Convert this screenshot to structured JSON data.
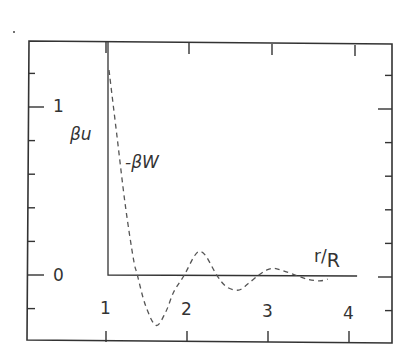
{
  "chart_data": {
    "type": "line",
    "title": "",
    "xlabel": "r/R",
    "ylabel": "βu",
    "curve_label": "-βW",
    "xlim": [
      0.0,
      4.5
    ],
    "ylim": [
      -0.4,
      1.4
    ],
    "x_ticks": [
      1,
      2,
      3,
      4
    ],
    "x_tick_labels": [
      "1",
      "2",
      "3",
      "4"
    ],
    "y_ticks": [
      -0.2,
      0,
      0.2,
      0.4,
      0.6,
      0.8,
      1.0,
      1.2
    ],
    "y_tick_labels": [
      "0",
      "1"
    ],
    "y_labeled_ticks": [
      0,
      1
    ],
    "grid": false,
    "legend": null,
    "series": [
      {
        "name": "βu (hard-core potential)",
        "style": "solid",
        "x": [
          1.0,
          1.0,
          4.1
        ],
        "y": [
          1.4,
          0.0,
          0.0
        ]
      },
      {
        "name": "-βW",
        "style": "dashed",
        "x": [
          1.0,
          1.1,
          1.2,
          1.3,
          1.35,
          1.45,
          1.58,
          1.7,
          1.8,
          1.93,
          2.05,
          2.12,
          2.2,
          2.33,
          2.45,
          2.6,
          2.72,
          2.85,
          2.95,
          3.04,
          3.15,
          3.3,
          3.45,
          3.6,
          3.7
        ],
        "y": [
          1.22,
          0.82,
          0.42,
          0.1,
          0.0,
          -0.18,
          -0.3,
          -0.22,
          -0.1,
          0.0,
          0.11,
          0.14,
          0.11,
          0.0,
          -0.07,
          -0.09,
          -0.05,
          0.0,
          0.03,
          0.04,
          0.025,
          0.0,
          -0.025,
          -0.035,
          -0.025
        ]
      }
    ]
  },
  "labels": {
    "y_one": "1",
    "y_zero": "0",
    "beta_u": "βu",
    "minus_beta_w": "-βW",
    "r_over": "r/",
    "r_over_sub": "R",
    "x_ticks": [
      "1",
      "2",
      "3",
      "4"
    ]
  }
}
